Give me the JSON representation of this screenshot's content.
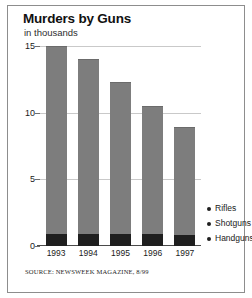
{
  "chart_data": {
    "type": "bar",
    "title": "Murders by Guns",
    "subtitle": "in thousands",
    "xlabel": "",
    "ylabel": "in thousands",
    "categories": [
      "1993",
      "1994",
      "1995",
      "1996",
      "1997"
    ],
    "ylim": [
      0,
      15
    ],
    "yticks": [
      0,
      5,
      10,
      15
    ],
    "ytick_labels": [
      "0",
      "5",
      "10",
      "15"
    ],
    "grid": true,
    "legend_position": "right-bottom",
    "stacked": true,
    "series": [
      {
        "name": "Rifles",
        "values": [
          0.0,
          0.0,
          0.0,
          0.0,
          0.0
        ],
        "color": "#7d7d7d"
      },
      {
        "name": "Shotguns",
        "values": [
          14.1,
          13.1,
          11.4,
          9.6,
          8.1
        ],
        "color": "#7d7d7d"
      },
      {
        "name": "Handguns",
        "values": [
          0.9,
          0.9,
          0.9,
          0.9,
          0.8
        ],
        "color": "#1f1f1f"
      }
    ],
    "totals": [
      15.0,
      14.0,
      12.3,
      10.5,
      8.9
    ],
    "source": "SOURCE: NEWSWEEK MAGAZINE, 8/99",
    "colors": {
      "bar_main": "#7d7d7d",
      "bar_dark": "#1f1f1f",
      "gridline": "#c9c9c9",
      "axis": "#4a4a4a",
      "frame": "#8d8d8d",
      "background": "#ffffff"
    }
  },
  "legend": {
    "items": [
      {
        "label": "Rifles"
      },
      {
        "label": "Shotguns"
      },
      {
        "label": "Handguns"
      }
    ]
  }
}
